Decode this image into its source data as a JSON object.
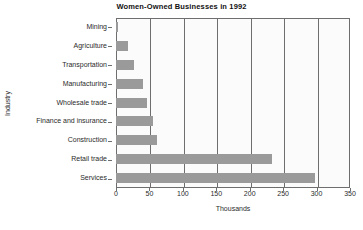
{
  "chart_data": {
    "type": "bar",
    "orientation": "horizontal",
    "title": "Women-Owned Businesses in 1992",
    "xlabel": "Thousands",
    "ylabel": "Industry",
    "categories": [
      "Mining",
      "Agriculture",
      "Transportation",
      "Manufacturing",
      "Wholesale trade",
      "Finance and insurance",
      "Construction",
      "Retail trade",
      "Services"
    ],
    "values": [
      3,
      18,
      27,
      40,
      46,
      55,
      62,
      234,
      297
    ],
    "xlim": [
      0,
      350
    ],
    "xticks": [
      0,
      50,
      100,
      150,
      200,
      250,
      300,
      350
    ],
    "xtick_labels": [
      "0",
      "50",
      "100",
      "150",
      "200",
      "250",
      "300",
      "350"
    ],
    "grid": "vertical",
    "legend": "none",
    "bar_color": "#9a9a9a",
    "plot_background": "#fbfbfb",
    "axis_color": "#6e6e6e"
  }
}
